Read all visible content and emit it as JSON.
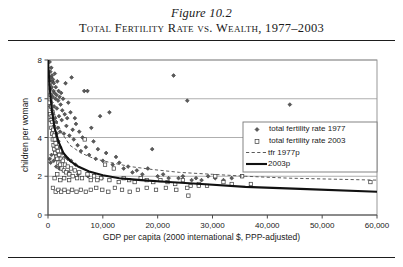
{
  "figure": {
    "label": "Figure 10.2",
    "title": "Total Fertility Rate vs. Wealth, 1977–2003"
  },
  "chart_data": {
    "type": "scatter",
    "title": "Total Fertility Rate vs. Wealth, 1977–2003",
    "xlabel": "GDP per capita (2000 international $, PPP-adjusted)",
    "ylabel": "children per woman",
    "xlim": [
      0,
      60000
    ],
    "ylim": [
      0,
      8
    ],
    "xticks": [
      0,
      10000,
      20000,
      30000,
      40000,
      50000,
      60000
    ],
    "xticklabels": [
      "0",
      "10,000",
      "20,000",
      "30,000",
      "40,000",
      "50,000",
      "60,000"
    ],
    "yticks": [
      0,
      2,
      4,
      6,
      8
    ],
    "yticklabels": [
      "0",
      "2",
      "4",
      "6",
      "8"
    ],
    "grid": "horizontal",
    "legend_position": "center-right",
    "legend": [
      {
        "label": "total fertility rate 1977",
        "marker": "diamond",
        "style": "scatter"
      },
      {
        "label": "total fertility rate 2003",
        "marker": "square",
        "style": "scatter"
      },
      {
        "label": "tfr 1977p",
        "marker": "line",
        "style": "dashed"
      },
      {
        "label": "2003p",
        "marker": "line",
        "style": "solid-thick"
      }
    ],
    "series": [
      {
        "name": "total fertility rate 1977",
        "marker": "diamond",
        "points": [
          [
            300,
            7.9
          ],
          [
            380,
            6.9
          ],
          [
            420,
            7.4
          ],
          [
            470,
            6.5
          ],
          [
            520,
            7.1
          ],
          [
            560,
            6.2
          ],
          [
            600,
            7.6
          ],
          [
            640,
            5.8
          ],
          [
            680,
            6.6
          ],
          [
            720,
            7.2
          ],
          [
            760,
            5.4
          ],
          [
            800,
            6.9
          ],
          [
            850,
            6.1
          ],
          [
            900,
            7.0
          ],
          [
            950,
            5.2
          ],
          [
            1000,
            6.4
          ],
          [
            1060,
            6.8
          ],
          [
            1120,
            5.6
          ],
          [
            1180,
            6.3
          ],
          [
            1240,
            7.3
          ],
          [
            1300,
            5.0
          ],
          [
            1360,
            6.0
          ],
          [
            1420,
            6.6
          ],
          [
            1480,
            4.8
          ],
          [
            1550,
            6.2
          ],
          [
            1620,
            5.5
          ],
          [
            1700,
            6.9
          ],
          [
            1780,
            4.5
          ],
          [
            1850,
            5.9
          ],
          [
            1930,
            6.4
          ],
          [
            2000,
            5.1
          ],
          [
            2100,
            6.1
          ],
          [
            2200,
            4.3
          ],
          [
            2300,
            5.7
          ],
          [
            2400,
            6.3
          ],
          [
            2500,
            4.9
          ],
          [
            2600,
            5.4
          ],
          [
            2750,
            6.0
          ],
          [
            2900,
            4.2
          ],
          [
            3050,
            5.2
          ],
          [
            3200,
            6.8
          ],
          [
            3350,
            4.6
          ],
          [
            3500,
            5.0
          ],
          [
            3700,
            5.8
          ],
          [
            3900,
            4.1
          ],
          [
            4100,
            5.3
          ],
          [
            4300,
            7.1
          ],
          [
            4500,
            4.4
          ],
          [
            4700,
            3.9
          ],
          [
            4900,
            5.0
          ],
          [
            5100,
            4.7
          ],
          [
            5400,
            3.6
          ],
          [
            5700,
            4.3
          ],
          [
            6000,
            3.3
          ],
          [
            6300,
            4.0
          ],
          [
            6600,
            6.4
          ],
          [
            6900,
            3.5
          ],
          [
            7200,
            6.4
          ],
          [
            7500,
            3.1
          ],
          [
            7900,
            4.5
          ],
          [
            8300,
            3.8
          ],
          [
            8700,
            2.9
          ],
          [
            9100,
            3.4
          ],
          [
            9500,
            5.1
          ],
          [
            10000,
            2.8
          ],
          [
            10600,
            3.2
          ],
          [
            11200,
            5.3
          ],
          [
            11800,
            2.6
          ],
          [
            12400,
            3.0
          ],
          [
            13000,
            2.7
          ],
          [
            13800,
            2.4
          ],
          [
            14600,
            2.5
          ],
          [
            15400,
            2.2
          ],
          [
            16200,
            2.3
          ],
          [
            17200,
            2.1
          ],
          [
            18200,
            2.4
          ],
          [
            19000,
            3.4
          ],
          [
            20000,
            2.0
          ],
          [
            21000,
            2.1
          ],
          [
            22000,
            1.9
          ],
          [
            22900,
            7.2
          ],
          [
            23800,
            1.9
          ],
          [
            24600,
            2.0
          ],
          [
            25400,
            5.9
          ],
          [
            26200,
            1.8
          ],
          [
            27000,
            1.9
          ],
          [
            28000,
            1.8
          ],
          [
            29200,
            2.0
          ],
          [
            30500,
            1.9
          ],
          [
            32000,
            1.8
          ],
          [
            33500,
            1.9
          ],
          [
            35400,
            2.0
          ],
          [
            44100,
            5.7
          ],
          [
            400,
            5.6
          ],
          [
            550,
            4.9
          ],
          [
            700,
            5.1
          ],
          [
            900,
            4.4
          ],
          [
            1100,
            4.6
          ],
          [
            1300,
            4.0
          ],
          [
            1600,
            4.2
          ],
          [
            1900,
            3.8
          ],
          [
            2200,
            3.5
          ],
          [
            2600,
            3.2
          ],
          [
            3100,
            3.0
          ],
          [
            3600,
            2.9
          ],
          [
            4200,
            2.8
          ],
          [
            5000,
            2.6
          ],
          [
            320,
            2.9
          ],
          [
            480,
            2.7
          ],
          [
            640,
            3.1
          ],
          [
            1050,
            2.8
          ],
          [
            1500,
            2.5
          ],
          [
            2050,
            2.4
          ],
          [
            2800,
            2.3
          ],
          [
            3800,
            2.2
          ],
          [
            5500,
            2.1
          ],
          [
            7300,
            2.0
          ],
          [
            9800,
            1.9
          ]
        ]
      },
      {
        "name": "total fertility rate 2003",
        "marker": "square",
        "points": [
          [
            300,
            5.8
          ],
          [
            350,
            6.8
          ],
          [
            400,
            5.2
          ],
          [
            450,
            6.2
          ],
          [
            500,
            4.9
          ],
          [
            560,
            5.6
          ],
          [
            620,
            4.5
          ],
          [
            680,
            5.1
          ],
          [
            740,
            4.2
          ],
          [
            800,
            4.8
          ],
          [
            870,
            3.9
          ],
          [
            940,
            4.4
          ],
          [
            1010,
            3.6
          ],
          [
            1080,
            4.1
          ],
          [
            1160,
            3.4
          ],
          [
            1240,
            3.9
          ],
          [
            1320,
            3.2
          ],
          [
            1400,
            3.7
          ],
          [
            1500,
            3.0
          ],
          [
            1600,
            3.5
          ],
          [
            1700,
            2.9
          ],
          [
            1800,
            3.3
          ],
          [
            1900,
            2.7
          ],
          [
            2050,
            3.1
          ],
          [
            2200,
            2.6
          ],
          [
            2350,
            2.9
          ],
          [
            2500,
            2.4
          ],
          [
            2700,
            2.8
          ],
          [
            2900,
            2.3
          ],
          [
            3100,
            2.6
          ],
          [
            3300,
            2.2
          ],
          [
            3600,
            2.5
          ],
          [
            3900,
            2.1
          ],
          [
            4200,
            2.4
          ],
          [
            4500,
            2.0
          ],
          [
            4900,
            2.3
          ],
          [
            5300,
            1.9
          ],
          [
            5700,
            2.2
          ],
          [
            6200,
            1.9
          ],
          [
            6700,
            3.9
          ],
          [
            7200,
            2.1
          ],
          [
            7800,
            1.8
          ],
          [
            8400,
            2.0
          ],
          [
            9000,
            1.8
          ],
          [
            9700,
            1.9
          ],
          [
            10400,
            2.6
          ],
          [
            11200,
            1.8
          ],
          [
            12000,
            2.4
          ],
          [
            12900,
            1.7
          ],
          [
            13800,
            1.9
          ],
          [
            14800,
            1.8
          ],
          [
            15800,
            1.7
          ],
          [
            16900,
            1.9
          ],
          [
            18000,
            1.8
          ],
          [
            19200,
            1.7
          ],
          [
            20500,
            1.8
          ],
          [
            21800,
            1.7
          ],
          [
            23200,
            1.6
          ],
          [
            24600,
            1.8
          ],
          [
            26000,
            1.5
          ],
          [
            25600,
            1.0
          ],
          [
            27500,
            1.6
          ],
          [
            29000,
            1.5
          ],
          [
            30500,
            2.0
          ],
          [
            32000,
            1.7
          ],
          [
            33500,
            1.6
          ],
          [
            35400,
            2.0
          ],
          [
            37000,
            1.6
          ],
          [
            58800,
            1.7
          ],
          [
            900,
            1.4
          ],
          [
            1400,
            1.2
          ],
          [
            1900,
            1.3
          ],
          [
            2400,
            1.2
          ],
          [
            3000,
            1.3
          ],
          [
            3700,
            1.2
          ],
          [
            4400,
            1.3
          ],
          [
            5200,
            1.2
          ],
          [
            6000,
            1.3
          ],
          [
            6900,
            1.2
          ],
          [
            7800,
            1.3
          ],
          [
            8800,
            1.4
          ],
          [
            9900,
            1.3
          ],
          [
            11000,
            1.2
          ],
          [
            12200,
            1.4
          ],
          [
            13500,
            1.3
          ],
          [
            14900,
            1.2
          ],
          [
            16400,
            1.3
          ],
          [
            18000,
            1.4
          ],
          [
            19700,
            1.3
          ],
          [
            21500,
            1.4
          ],
          [
            23400,
            1.3
          ],
          [
            25400,
            1.4
          ],
          [
            27500,
            1.5
          ],
          [
            1200,
            1.9
          ],
          [
            1700,
            2.1
          ],
          [
            2250,
            1.8
          ],
          [
            2950,
            1.9
          ],
          [
            3850,
            1.8
          ]
        ]
      }
    ],
    "trendlines": [
      {
        "name": "tfr 1977p",
        "style": "dashed",
        "points": [
          [
            0,
            8.0
          ],
          [
            400,
            6.6
          ],
          [
            900,
            5.6
          ],
          [
            1600,
            4.8
          ],
          [
            2600,
            4.2
          ],
          [
            4000,
            3.6
          ],
          [
            6000,
            3.2
          ],
          [
            8500,
            2.9
          ],
          [
            11500,
            2.7
          ],
          [
            15000,
            2.5
          ],
          [
            19000,
            2.35
          ],
          [
            24000,
            2.2
          ],
          [
            30000,
            2.1
          ],
          [
            36000,
            2.0
          ],
          [
            44000,
            1.9
          ],
          [
            52000,
            1.85
          ],
          [
            60000,
            1.8
          ]
        ]
      },
      {
        "name": "2003p",
        "style": "solid-thick",
        "points": [
          [
            0,
            8.0
          ],
          [
            300,
            6.6
          ],
          [
            700,
            5.4
          ],
          [
            1200,
            4.5
          ],
          [
            1900,
            3.8
          ],
          [
            2800,
            3.2
          ],
          [
            4000,
            2.8
          ],
          [
            5500,
            2.5
          ],
          [
            7500,
            2.25
          ],
          [
            10000,
            2.05
          ],
          [
            13000,
            1.9
          ],
          [
            17000,
            1.8
          ],
          [
            22000,
            1.7
          ],
          [
            28000,
            1.6
          ],
          [
            36000,
            1.45
          ],
          [
            46000,
            1.35
          ],
          [
            60000,
            1.2
          ]
        ]
      }
    ]
  }
}
